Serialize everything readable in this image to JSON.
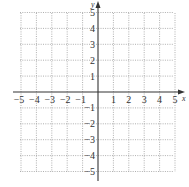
{
  "chart_data": {
    "type": "scatter",
    "title": "",
    "xlabel": "x",
    "ylabel": "y",
    "xlim": [
      -5,
      5
    ],
    "ylim": [
      -5,
      5
    ],
    "grid": true,
    "grid_style": "dotted",
    "x_ticks": [
      -5,
      -4,
      -3,
      -2,
      -1,
      1,
      2,
      3,
      4,
      5
    ],
    "y_ticks": [
      5,
      4,
      3,
      2,
      1,
      -1,
      -2,
      -3,
      -4,
      -5
    ],
    "x_tick_labels": [
      "−5",
      "−4",
      "−3",
      "−2",
      "−1",
      "1",
      "2",
      "3",
      "4",
      "5"
    ],
    "y_tick_labels": [
      "5",
      "4",
      "3",
      "2",
      "1",
      "−1",
      "−2",
      "−3",
      "−4",
      "−5"
    ],
    "series": [],
    "legend": null
  },
  "axes": {
    "x_label": "x",
    "y_label": "y"
  },
  "colors": {
    "axis": "#333333",
    "grid": "#9a9a9a",
    "background": "#ffffff"
  }
}
